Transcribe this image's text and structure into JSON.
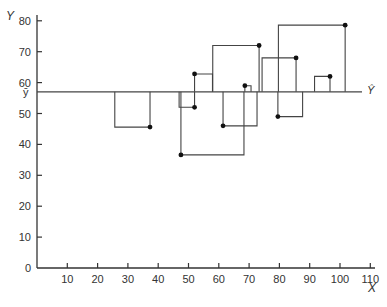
{
  "chart_data": {
    "type": "scatter",
    "title": "",
    "xlabel": "X",
    "ylabel": "Y",
    "xlim": [
      0,
      112
    ],
    "ylim": [
      0,
      82
    ],
    "grid": false,
    "x_ticks": [
      "10",
      "20",
      "30",
      "40",
      "50",
      "60",
      "70",
      "80",
      "90",
      "100",
      "110"
    ],
    "y_ticks": [
      "0",
      "10",
      "20",
      "30",
      "40",
      "50",
      "60",
      "70",
      "80"
    ],
    "mean_line": {
      "y": 57,
      "left_label": "ȳ",
      "right_label": "Ŷ"
    },
    "points": [
      {
        "x": 37.3,
        "y": 45.6,
        "square": "left"
      },
      {
        "x": 52.0,
        "y": 52.0,
        "square": "left"
      },
      {
        "x": 52.0,
        "y": 62.8,
        "square": "right"
      },
      {
        "x": 47.5,
        "y": 36.6,
        "square": "right"
      },
      {
        "x": 61.4,
        "y": 46.0,
        "square": "right"
      },
      {
        "x": 68.6,
        "y": 59.0,
        "square": "right"
      },
      {
        "x": 73.3,
        "y": 72.0,
        "square": "left"
      },
      {
        "x": 85.5,
        "y": 68.0,
        "square": "left"
      },
      {
        "x": 79.5,
        "y": 49.0,
        "square": "right"
      },
      {
        "x": 101.7,
        "y": 78.6,
        "square": "left"
      },
      {
        "x": 96.7,
        "y": 62.0,
        "square": "left"
      }
    ],
    "annotation": "Squared deviations from the mean drawn as squares"
  },
  "axes": {
    "x_label": "X",
    "y_label": "Y",
    "mean_left_label": "ȳ",
    "mean_right_label": "Ŷ",
    "zero_label": "0"
  }
}
